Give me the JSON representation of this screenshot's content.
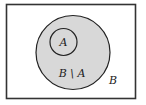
{
  "diagram": {
    "type": "venn",
    "colors": {
      "background": "#ffffff",
      "universe_stroke": "#333333",
      "outer_set_fill": "#d8d8d8",
      "stroke": "#222222",
      "text": "#222222"
    },
    "sets": [
      {
        "name": "A",
        "label": "A",
        "relation": "subset of B"
      },
      {
        "name": "B",
        "label": "B"
      }
    ],
    "labels": {
      "inner_circle": "A",
      "difference_region": "B \\ A",
      "outer_circle": "B"
    }
  }
}
